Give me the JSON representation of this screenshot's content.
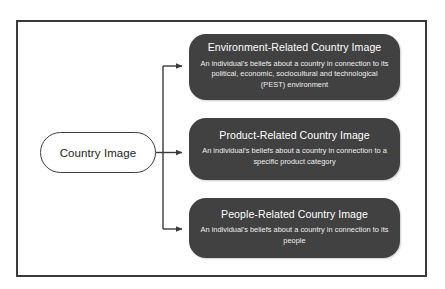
{
  "figure": {
    "frame_color": "#3a3a3a",
    "background": "#ffffff"
  },
  "source": {
    "id": "country-image",
    "label": "Country Image",
    "fill": "#ffffff",
    "border_color": "#3f3f3f",
    "text_color": "#1d1d1d"
  },
  "branches": [
    {
      "id": "environment-related",
      "title": "Environment-Related Country Image",
      "description": "An individual's beliefs about a country in connection to its political, economic, sociocultural and technological (PEST) environment",
      "fill": "#414141",
      "text_color": "#ffffff"
    },
    {
      "id": "product-related",
      "title": "Product-Related Country Image",
      "description": "An individual's beliefs about a country in connection to a specific product category",
      "fill": "#414141",
      "text_color": "#ffffff"
    },
    {
      "id": "people-related",
      "title": "People-Related Country Image",
      "description": "An individual's beliefs about a country in connection to its people",
      "fill": "#414141",
      "text_color": "#ffffff"
    }
  ],
  "connector": {
    "style": "orthogonal-arrow",
    "color": "#3a3a3a",
    "arrow_count": 3
  }
}
